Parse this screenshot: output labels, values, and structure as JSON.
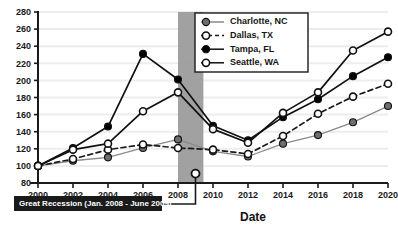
{
  "chart_data": {
    "type": "line",
    "title": "",
    "xlabel": "Date",
    "ylabel": "",
    "categories": [
      2000,
      2002,
      2004,
      2006,
      2008,
      2010,
      2012,
      2014,
      2016,
      2018,
      2020
    ],
    "x": [
      2000,
      2002,
      2004,
      2006,
      2008,
      2010,
      2012,
      2014,
      2016,
      2018,
      2020
    ],
    "xlim": [
      2000,
      2020
    ],
    "ylim": [
      80,
      280
    ],
    "yticks": [
      80,
      100,
      120,
      140,
      160,
      180,
      200,
      220,
      240,
      260,
      280
    ],
    "xticks": [
      2000,
      2002,
      2004,
      2006,
      2008,
      2010,
      2012,
      2014,
      2016,
      2018,
      2020
    ],
    "grid": true,
    "grid_axis": "y",
    "legend_position": "top-right",
    "series": [
      {
        "name": "Charlotte, NC",
        "marker": "filled-circle",
        "marker_color": "#6e6e6e",
        "line_color": "#8a8a8a",
        "line_style": "solid",
        "values": [
          100,
          106,
          110,
          121,
          131,
          117,
          111,
          126,
          136,
          151,
          170
        ]
      },
      {
        "name": "Dallas, TX",
        "marker": "open-circle",
        "marker_color": "#ffffff",
        "line_color": "#1a1a1a",
        "line_style": "dashed",
        "values": [
          100,
          108,
          119,
          125,
          121,
          119,
          114,
          135,
          161,
          181,
          196
        ]
      },
      {
        "name": "Tampa, FL",
        "marker": "filled-circle",
        "marker_color": "#000000",
        "line_color": "#111111",
        "line_style": "solid",
        "values": [
          100,
          121,
          146,
          231,
          201,
          147,
          130,
          157,
          178,
          205,
          227
        ]
      },
      {
        "name": "Seattle, WA",
        "marker": "open-circle",
        "marker_color": "#ffffff",
        "line_color": "#111111",
        "line_style": "solid",
        "values": [
          100,
          119,
          126,
          164,
          186,
          143,
          127,
          162,
          186,
          235,
          257
        ]
      }
    ],
    "annotations": [
      {
        "id": "great-recession",
        "label": "Great Recession (Jan. 2008 - June 2009)",
        "type": "shaded-band-with-callout",
        "band_start": 2008.0,
        "band_end": 2009.45,
        "band_color": "#999999",
        "callout_background": "#1a1a1a",
        "callout_text_color": "#ffffff",
        "pointer_marker": "open-circle",
        "pointer_x": 2009,
        "pointer_y": 91
      }
    ]
  },
  "legend": {
    "entries": [
      "Charlotte, NC",
      "Dallas, TX",
      "Tampa, FL",
      "Seattle, WA"
    ],
    "border_color": "#1a1a1a",
    "background": "#ffffff"
  },
  "axes": {
    "x_title": "Date",
    "y_tick_labels": [
      "280",
      "260",
      "240",
      "220",
      "200",
      "180",
      "160",
      "140",
      "120",
      "100",
      "80"
    ],
    "x_tick_labels": [
      "2000",
      "2002",
      "2004",
      "2006",
      "2008",
      "2010",
      "2012",
      "2014",
      "2016",
      "2018",
      "2020"
    ]
  },
  "colors": {
    "axis": "#1a1a1a",
    "grid": "#ededed",
    "recession_band": "#999999",
    "charlotte": "#6e6e6e",
    "dallas": "#1a1a1a",
    "tampa": "#000000",
    "seattle": "#111111"
  }
}
